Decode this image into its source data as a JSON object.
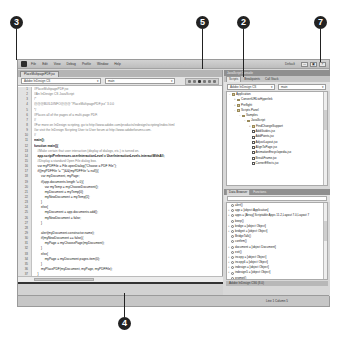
{
  "menubar": {
    "items": [
      "File",
      "Edit",
      "View",
      "Debug",
      "Profile",
      "Window",
      "Help"
    ],
    "workspace": "Default",
    "window_buttons": [
      "—",
      "▣",
      "×"
    ]
  },
  "editor": {
    "doc_tab": "PlaceMultipagePDF.jsx",
    "target_select": "Adobe InDesign CS",
    "function_select": "main",
    "line_numbers": [
      "1",
      "2",
      "3",
      "4",
      "5",
      "6",
      "7",
      "8",
      "9",
      "10",
      "11",
      "12",
      "13",
      "14",
      "15",
      "16",
      "17",
      "18",
      "19",
      "20",
      "21",
      "22",
      "23",
      "24",
      "25",
      "26",
      "27",
      "28",
      "29",
      "30",
      "31",
      "32",
      "33",
      "34",
      "35",
      "36",
      "37"
    ],
    "lines": [
      {
        "text": "//PlaceMultipagePDF.jsx",
        "style": "comment"
      },
      {
        "text": "//An InDesign CS JavaScript",
        "style": "comment"
      },
      {
        "text": "/*",
        "style": "comment"
      },
      {
        "text": "@@@BUILDINFO@@@ \"PlaceMultipagePDF.jsx\" 3.0.0",
        "style": "comment"
      },
      {
        "text": "*/",
        "style": "comment"
      },
      {
        "text": "//Places all of the pages of a multi-page PDF.",
        "style": "comment"
      },
      {
        "text": "//",
        "style": "comment"
      },
      {
        "text": "//For more on InDesign scripting, go to http://www.adobe.com/products/indesign/scripting/index.html",
        "style": "comment"
      },
      {
        "text": "//or visit the InDesign Scripting User to User forum at http://www.adobeforums.com.",
        "style": "comment"
      },
      {
        "text": "//",
        "style": "comment"
      },
      {
        "text": "main();",
        "style": "bold"
      },
      {
        "text": "function main(){",
        "style": "bold"
      },
      {
        "text": "    //Make certain that user interaction (display of dialogs, etc.) is turned on.",
        "style": "comment"
      },
      {
        "text": "    app.scriptPreferences.userInteractionLevel = UserInteractionLevels.interactWithAll;",
        "style": "bold"
      },
      {
        "text": "    //Display a standard Open File dialog box.",
        "style": "comment"
      },
      {
        "text": "    var myPDFFile = File.openDialog(\"Choose a PDF File\");",
        "style": "normal"
      },
      {
        "text": "    if((myPDFFile != \"\")&&(myPDFFile != null)){",
        "style": "normal"
      },
      {
        "text": "        var myDocument, myPage;",
        "style": "normal"
      },
      {
        "text": "        if(app.documents.length != 0){",
        "style": "normal"
      },
      {
        "text": "            var myTemp = myChooseDocument();",
        "style": "normal"
      },
      {
        "text": "            myDocument = myTemp[0];",
        "style": "normal"
      },
      {
        "text": "            myNewDocument = myTemp[1];",
        "style": "normal"
      },
      {
        "text": "        }",
        "style": "normal"
      },
      {
        "text": "        else{",
        "style": "normal"
      },
      {
        "text": "            myDocument = app.documents.add();",
        "style": "normal"
      },
      {
        "text": "            myNewDocument = false;",
        "style": "normal"
      },
      {
        "text": "        }",
        "style": "normal"
      },
      {
        "text": "",
        "style": "normal"
      },
      {
        "text": "        alert(myDocument.constructor.name);",
        "style": "normal"
      },
      {
        "text": "        if(myNewDocument == false){",
        "style": "normal"
      },
      {
        "text": "            myPage = myChoosePage(myDocument);",
        "style": "normal"
      },
      {
        "text": "        }",
        "style": "normal"
      },
      {
        "text": "        else{",
        "style": "normal"
      },
      {
        "text": "            myPage = myDocument.pages.item(0);",
        "style": "normal"
      },
      {
        "text": "        }",
        "style": "normal"
      },
      {
        "text": "        myPlacePDF(myDocument, myPage, myPDFFile);",
        "style": "normal"
      },
      {
        "text": "    }",
        "style": "normal"
      }
    ]
  },
  "scripts_panel": {
    "title": "JavaScript Console",
    "tabs": [
      "Scripts",
      "Breakpoints",
      "Call Stack"
    ],
    "target_select": "Adobe InDesign CS",
    "function_select": "main",
    "tree": [
      {
        "label": "Application",
        "depth": 0,
        "type": "folder",
        "expanded": true
      },
      {
        "label": "ConvertURLtoHyperlink",
        "depth": 1,
        "type": "folder",
        "expanded": false
      },
      {
        "label": "Preflight",
        "depth": 1,
        "type": "folder",
        "expanded": false
      },
      {
        "label": "Scripts Panel",
        "depth": 1,
        "type": "folder",
        "expanded": true
      },
      {
        "label": "Samples",
        "depth": 2,
        "type": "folder",
        "expanded": true
      },
      {
        "label": "JavaScript",
        "depth": 3,
        "type": "folder",
        "expanded": true
      },
      {
        "label": "FindChangeSupport",
        "depth": 4,
        "type": "folder",
        "expanded": false
      },
      {
        "label": "AddGuides.jsx",
        "depth": 4,
        "type": "file"
      },
      {
        "label": "AddPoints.jsx",
        "depth": 4,
        "type": "file"
      },
      {
        "label": "AdjustLayout.jsx",
        "depth": 4,
        "type": "file"
      },
      {
        "label": "AlignToPage.jsx",
        "depth": 4,
        "type": "file"
      },
      {
        "label": "AnimationEncyclopedia.jsx",
        "depth": 4,
        "type": "file"
      },
      {
        "label": "BreakFrame.jsx",
        "depth": 4,
        "type": "file"
      },
      {
        "label": "CornerEffects.jsx",
        "depth": 4,
        "type": "file"
      }
    ]
  },
  "data_browser": {
    "tabs": [
      "Data Browser",
      "Functions"
    ],
    "filter_placeholder": "",
    "items": [
      {
        "label": "alert()",
        "expandable": false
      },
      {
        "label": "app = [object Application]",
        "expandable": true
      },
      {
        "label": "apps = [Array] Scriptable Apps 11.2,Layout 7.0,Layout 7",
        "expandable": true
      },
      {
        "label": "beep()",
        "expandable": false
      },
      {
        "label": "bridge = [object Object]",
        "expandable": true
      },
      {
        "label": "bridgeit = [object Object]",
        "expandable": true
      },
      {
        "label": "BridgeTalk()",
        "expandable": false
      },
      {
        "label": "confirm()",
        "expandable": false
      },
      {
        "label": "document = [object Document]",
        "expandable": true
      },
      {
        "label": "exit()",
        "expandable": false
      },
      {
        "label": "incopy = [object Object]",
        "expandable": true
      },
      {
        "label": "incopy6 = [object Object]",
        "expandable": true
      },
      {
        "label": "indesign = [object Object]",
        "expandable": true
      },
      {
        "label": "indesign5 = [object Object]",
        "expandable": true
      },
      {
        "label": "prompt()",
        "expandable": false
      },
      {
        "label": "resolve()",
        "expandable": false
      }
    ],
    "footer": "Adobe InDesign CS6 (8.0)"
  },
  "statusbar": {
    "text": "Line 1   Column 5"
  },
  "callouts": [
    {
      "number": "3",
      "x": 10,
      "y": 16
    },
    {
      "number": "5",
      "x": 196,
      "y": 16
    },
    {
      "number": "2",
      "x": 237,
      "y": 16
    },
    {
      "number": "7",
      "x": 314,
      "y": 16
    },
    {
      "number": "4",
      "x": 118,
      "y": 317
    }
  ]
}
